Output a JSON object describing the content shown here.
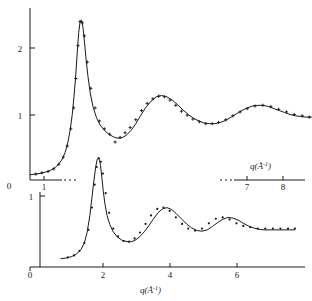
{
  "figure": {
    "title": "",
    "axis_label": "q(Å⁻¹)",
    "axis_label_base": "q(Å",
    "axis_label_sup": "-1",
    "axis_label_close": ")"
  },
  "upper_panel": {
    "y_ticks": [
      "0",
      "1",
      "2"
    ],
    "y_tick_values": [
      0,
      1,
      2
    ],
    "x_ticks": [
      "0",
      "1",
      "7",
      "8"
    ],
    "x_tick_values": [
      0,
      1,
      7,
      8
    ],
    "axis_label": "q(Å⁻¹)",
    "axis_broken": true
  },
  "lower_panel": {
    "y_ticks": [
      "1"
    ],
    "y_tick_values": [
      1
    ],
    "x_ticks": [
      "0",
      "2",
      "4",
      "6"
    ],
    "x_tick_values": [
      0,
      2,
      4,
      6
    ],
    "axis_label": "q(Å⁻¹)"
  },
  "chart_data": {
    "type": "line",
    "title": "",
    "xlabel": "q(Å⁻¹)",
    "ylabel": "",
    "xlim": [
      0,
      8.6
    ],
    "ylim": [
      0,
      2.55
    ],
    "grid": false,
    "legend": null,
    "note": "Two structure-factor style curves S(q) vs q, each with a solid fitted line plus discrete measured data points. The lower curve is offset downward and drawn on its own shifted baseline.",
    "series": [
      {
        "name": "upper-curve-line",
        "style": "line",
        "x": [
          0.62,
          0.75,
          0.9,
          1.05,
          1.2,
          1.32,
          1.42,
          1.52,
          1.6,
          1.68,
          1.74,
          1.8,
          1.85,
          1.9,
          1.94,
          1.98,
          2.02,
          2.06,
          2.1,
          2.14,
          2.18,
          2.24,
          2.3,
          2.38,
          2.48,
          2.58,
          2.7,
          2.82,
          2.95,
          3.05,
          3.15,
          3.25,
          3.35,
          3.45,
          3.58,
          3.7,
          3.85,
          4.0,
          4.15,
          4.3,
          4.45,
          4.6,
          4.75,
          4.9,
          5.05,
          5.2,
          5.35,
          5.5,
          5.65,
          5.8,
          5.95,
          6.1,
          6.25,
          6.4,
          6.55,
          6.7,
          6.85,
          7.0,
          7.15,
          7.3,
          7.45,
          7.6,
          7.75,
          7.9,
          8.05,
          8.2,
          8.35,
          8.5
        ],
        "y": [
          0.08,
          0.09,
          0.1,
          0.12,
          0.15,
          0.19,
          0.24,
          0.32,
          0.42,
          0.58,
          0.76,
          1.0,
          1.28,
          1.62,
          1.95,
          2.25,
          2.42,
          2.44,
          2.33,
          2.12,
          1.88,
          1.58,
          1.34,
          1.12,
          0.95,
          0.84,
          0.76,
          0.7,
          0.66,
          0.64,
          0.64,
          0.66,
          0.7,
          0.76,
          0.86,
          0.97,
          1.1,
          1.2,
          1.27,
          1.29,
          1.27,
          1.22,
          1.15,
          1.07,
          1.0,
          0.94,
          0.9,
          0.87,
          0.86,
          0.86,
          0.88,
          0.91,
          0.96,
          1.01,
          1.06,
          1.1,
          1.13,
          1.14,
          1.14,
          1.12,
          1.09,
          1.06,
          1.03,
          1.0,
          0.98,
          0.97,
          0.96,
          0.96
        ]
      },
      {
        "name": "upper-curve-points",
        "style": "points",
        "marker": "cross",
        "x": [
          0.78,
          0.95,
          1.12,
          1.28,
          1.42,
          1.55,
          1.66,
          1.76,
          1.84,
          1.9,
          1.96,
          2.02,
          2.08,
          2.14,
          2.22,
          2.32,
          2.44,
          2.56,
          2.7,
          2.85,
          3.0,
          3.14,
          3.28,
          3.42,
          3.58,
          3.74,
          3.9,
          4.06,
          4.22,
          4.38,
          4.54,
          4.7,
          4.86,
          5.02,
          5.18,
          5.36,
          5.54,
          5.72,
          5.9,
          6.1,
          6.3,
          6.5,
          6.7,
          6.92,
          7.14,
          7.36,
          7.58,
          7.8,
          8.02,
          8.24,
          8.44
        ],
        "y": [
          0.09,
          0.11,
          0.13,
          0.17,
          0.24,
          0.35,
          0.52,
          0.78,
          1.1,
          1.55,
          2.05,
          2.42,
          2.4,
          2.2,
          1.8,
          1.4,
          1.1,
          0.9,
          0.78,
          0.7,
          0.58,
          0.65,
          0.72,
          0.8,
          0.92,
          1.06,
          1.17,
          1.24,
          1.28,
          1.27,
          1.22,
          1.14,
          1.05,
          0.99,
          0.93,
          0.89,
          0.86,
          0.86,
          0.88,
          0.92,
          0.98,
          1.04,
          1.09,
          1.13,
          1.14,
          1.12,
          1.08,
          1.04,
          1.0,
          0.98,
          0.96
        ]
      },
      {
        "name": "lower-curve-line",
        "style": "line",
        "baseline_offset": true,
        "x": [
          0.9,
          1.05,
          1.2,
          1.35,
          1.48,
          1.58,
          1.66,
          1.74,
          1.8,
          1.86,
          1.91,
          1.95,
          1.99,
          2.02,
          2.05,
          2.09,
          2.13,
          2.18,
          2.24,
          2.32,
          2.42,
          2.54,
          2.68,
          2.82,
          2.96,
          3.08,
          3.2,
          3.32,
          3.45,
          3.58,
          3.72,
          3.85,
          3.98,
          4.12,
          4.25,
          4.4,
          4.55,
          4.7,
          4.85,
          5.0,
          5.15,
          5.3,
          5.45,
          5.6,
          5.75,
          5.9,
          6.05,
          6.2,
          6.35,
          6.5,
          6.65,
          6.8,
          6.95,
          7.1,
          7.25,
          7.4,
          7.55,
          7.7
        ],
        "y": [
          0.02,
          0.03,
          0.05,
          0.09,
          0.16,
          0.26,
          0.42,
          0.68,
          0.95,
          1.22,
          1.42,
          1.53,
          1.56,
          1.53,
          1.44,
          1.26,
          1.05,
          0.85,
          0.68,
          0.54,
          0.43,
          0.35,
          0.3,
          0.28,
          0.28,
          0.31,
          0.36,
          0.43,
          0.52,
          0.62,
          0.72,
          0.78,
          0.8,
          0.77,
          0.71,
          0.63,
          0.55,
          0.49,
          0.45,
          0.44,
          0.46,
          0.51,
          0.57,
          0.62,
          0.65,
          0.64,
          0.61,
          0.56,
          0.52,
          0.49,
          0.47,
          0.46,
          0.46,
          0.46,
          0.46,
          0.46,
          0.46,
          0.46
        ]
      },
      {
        "name": "lower-curve-points",
        "style": "points",
        "marker": "dot",
        "x": [
          1.1,
          1.28,
          1.44,
          1.58,
          1.7,
          1.8,
          1.88,
          1.94,
          2.0,
          2.06,
          2.12,
          2.2,
          2.3,
          2.42,
          2.56,
          2.72,
          2.88,
          3.04,
          3.2,
          3.36,
          3.52,
          3.7,
          3.88,
          4.06,
          4.24,
          4.42,
          4.6,
          4.8,
          5.0,
          5.2,
          5.4,
          5.6,
          5.8,
          6.0,
          6.2,
          6.4,
          6.62,
          6.84,
          7.06,
          7.28,
          7.5,
          7.7
        ],
        "y": [
          0.04,
          0.07,
          0.14,
          0.26,
          0.46,
          0.8,
          1.15,
          1.42,
          1.55,
          1.5,
          1.32,
          1.02,
          0.72,
          0.48,
          0.36,
          0.29,
          0.28,
          0.33,
          0.42,
          0.55,
          0.68,
          0.78,
          0.8,
          0.75,
          0.65,
          0.55,
          0.48,
          0.45,
          0.48,
          0.56,
          0.63,
          0.65,
          0.62,
          0.56,
          0.52,
          0.5,
          0.48,
          0.48,
          0.48,
          0.48,
          0.48,
          0.48
        ]
      }
    ]
  }
}
